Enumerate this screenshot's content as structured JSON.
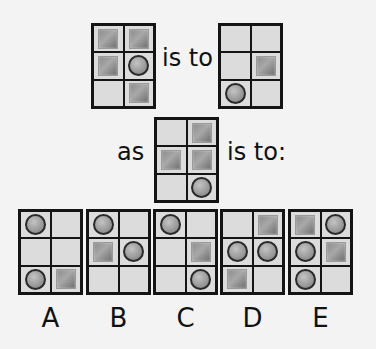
{
  "puzzle": {
    "words": {
      "is_to": "is to",
      "as": "as",
      "is_to_colon": "is to:"
    },
    "shape_legend": {
      "S": "gray-square",
      "C": "gray-circle",
      "_": "empty"
    },
    "question": [
      {
        "id": "q1",
        "cells": [
          "S",
          "S",
          "S",
          "C",
          "_",
          "S"
        ]
      },
      {
        "id": "q2",
        "cells": [
          "_",
          "_",
          "_",
          "S",
          "C",
          "_"
        ]
      },
      {
        "id": "q3",
        "cells": [
          "_",
          "S",
          "S",
          "S",
          "_",
          "C"
        ]
      }
    ],
    "options": [
      {
        "label": "A",
        "cells": [
          "C",
          "_",
          "_",
          "_",
          "C",
          "S"
        ]
      },
      {
        "label": "B",
        "cells": [
          "C",
          "_",
          "S",
          "C",
          "_",
          "_"
        ]
      },
      {
        "label": "C",
        "cells": [
          "C",
          "_",
          "_",
          "S",
          "_",
          "C"
        ]
      },
      {
        "label": "D",
        "cells": [
          "_",
          "S",
          "C",
          "C",
          "S",
          "_"
        ]
      },
      {
        "label": "E",
        "cells": [
          "S",
          "C",
          "C",
          "S",
          "C",
          "_"
        ]
      }
    ]
  }
}
